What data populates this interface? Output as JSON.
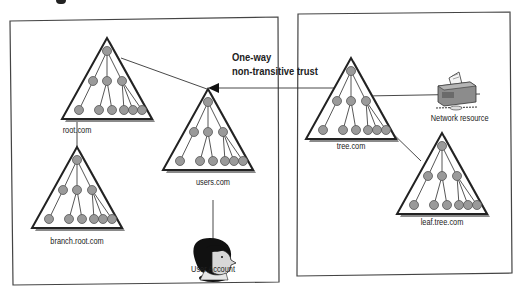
{
  "diagram": {
    "type": "trust-relationship-diagram",
    "trust_label": {
      "line1": "One-way",
      "line2": "non-transitive trust"
    },
    "left_forest": {
      "domains": [
        {
          "id": "root",
          "label": "root.com"
        },
        {
          "id": "branch",
          "label": "branch.root.com"
        },
        {
          "id": "users",
          "label": "users.com"
        }
      ],
      "user": {
        "label": "User Account"
      }
    },
    "right_forest": {
      "domains": [
        {
          "id": "tree",
          "label": "tree.com"
        },
        {
          "id": "leaf",
          "label": "leaf.tree.com"
        }
      ],
      "resource": {
        "label": "Network resource"
      }
    },
    "colors": {
      "node_fill": "#9a9a9a",
      "node_stroke": "#555555",
      "line": "#333333",
      "shadow": "#888888",
      "box_border": "#444444"
    }
  }
}
